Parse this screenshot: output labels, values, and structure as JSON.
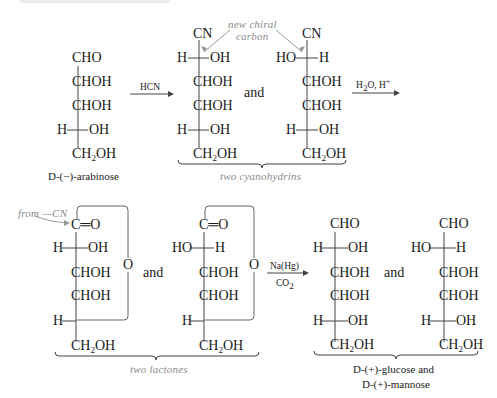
{
  "arabinose": {
    "rows": [
      "CHO",
      "CHOH",
      "CHOH",
      "H",
      "OH",
      "CH2OH"
    ],
    "name": "D-(−)-arabinose",
    "name_prefix": "D",
    "name_rest": "-(−)-arabinose"
  },
  "step1": {
    "reagent": "HCN"
  },
  "annotation_new_chiral": {
    "line1": "new chiral",
    "line2": "carbon"
  },
  "cyanohydrin1": {
    "top": "CN",
    "c2_left": "H",
    "c2_right": "OH",
    "c3": "CHOH",
    "c4": "CHOH",
    "c5_left": "H",
    "c5_right": "OH",
    "c6": "CH2OH"
  },
  "cyanohydrin2": {
    "top": "CN",
    "c2_left": "HO",
    "c2_right": "H",
    "c3": "CHOH",
    "c4": "CHOH",
    "c5_left": "H",
    "c5_right": "OH",
    "c6": "CH2OH"
  },
  "and_word": "and",
  "cyanohydrins_label": "two cyanohydrins",
  "step2": {
    "reagent": "H2O, H+"
  },
  "annotation_from_cn": "from —CN",
  "lactone1": {
    "top": "C═O",
    "c2_left": "H",
    "c2_right": "OH",
    "c3": "CHOH",
    "c4": "CHOH",
    "c5_left": "H",
    "c6": "CH2OH",
    "ring_o": "O"
  },
  "lactone2": {
    "top": "C═O",
    "c2_left": "HO",
    "c2_right": "H",
    "c3": "CHOH",
    "c4": "CHOH",
    "c5_left": "H",
    "c6": "CH2OH",
    "ring_o": "O"
  },
  "lactones_label": "two lactones",
  "step3": {
    "reagent_top": "Na(Hg)",
    "reagent_bottom": "CO2"
  },
  "glucose": {
    "top": "CHO",
    "c2_left": "H",
    "c2_right": "OH",
    "c3": "CHOH",
    "c4": "CHOH",
    "c5_left": "H",
    "c5_right": "OH",
    "c6": "CH2OH"
  },
  "mannose": {
    "top": "CHO",
    "c2_left": "HO",
    "c2_right": "H",
    "c3": "CHOH",
    "c4": "CHOH",
    "c5_left": "H",
    "c5_right": "OH",
    "c6": "CH2OH"
  },
  "products_label": {
    "line1_prefix": "D",
    "line1_rest": "-(+)-glucose and",
    "line2_prefix": "D",
    "line2_rest": "-(+)-mannose"
  }
}
